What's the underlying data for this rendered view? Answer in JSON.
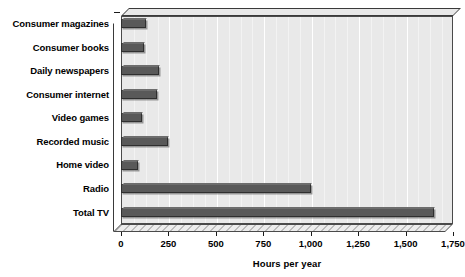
{
  "chart_data": {
    "type": "bar",
    "orientation": "horizontal",
    "title": "",
    "xlabel": "Hours per year",
    "ylabel": "",
    "categories": [
      "Consumer magazines",
      "Consumer books",
      "Daily newspapers",
      "Consumer internet",
      "Video games",
      "Recorded music",
      "Home video",
      "Radio",
      "Total TV"
    ],
    "values": [
      130,
      120,
      200,
      190,
      110,
      250,
      90,
      1000,
      1650
    ],
    "xlim": [
      0,
      1750
    ],
    "xticks": [
      0,
      250,
      500,
      750,
      1000,
      1250,
      1500,
      1750
    ],
    "xtick_labels": [
      "0",
      "250",
      "500",
      "750",
      "1,000",
      "1,250",
      "1,500",
      "1,750"
    ],
    "grid": true,
    "grid_axis": "x",
    "legend": false,
    "series": [
      {
        "name": "Hours per year",
        "values": [
          130,
          120,
          200,
          190,
          110,
          250,
          90,
          1000,
          1650
        ]
      }
    ]
  },
  "colors": {
    "bar_fill": "#595959",
    "bar_border": "#2f2f2f",
    "plot_background": "#e9e9e9",
    "gridline": "#ffffff",
    "axis": "#1a1a1a",
    "text": "#000000",
    "page_background": "#ffffff"
  }
}
